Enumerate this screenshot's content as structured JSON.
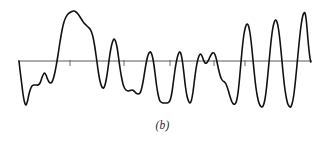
{
  "figure": {
    "caption": "(b)",
    "type": "waveform-trace",
    "background_color": "#ffffff",
    "trace_color": "#111111",
    "axis_color": "#5a5a5a",
    "caption_color": "#2a2a2a"
  },
  "chart_data": {
    "type": "line",
    "title": "",
    "subtitle": "",
    "xlabel": "",
    "ylabel": "",
    "annotations": [
      "(b)"
    ],
    "legend": [],
    "legend_position": "none",
    "grid": false,
    "xlim": [
      0,
      325
    ],
    "ylim": [
      0,
      143
    ],
    "baseline_y": 61,
    "baseline_x_start": 18,
    "baseline_x_end": 312,
    "tick_marks_x": [
      70,
      124,
      170,
      214,
      245
    ],
    "tick_length": 5,
    "series": [
      {
        "name": "signal",
        "color": "#111111",
        "line_width": 1.6,
        "points": [
          [
            19,
            61
          ],
          [
            20,
            70
          ],
          [
            21.5,
            82
          ],
          [
            23,
            94
          ],
          [
            24.5,
            102
          ],
          [
            26,
            105
          ],
          [
            27.5,
            101
          ],
          [
            29,
            94
          ],
          [
            30.5,
            89
          ],
          [
            32,
            86
          ],
          [
            34,
            85
          ],
          [
            36,
            85
          ],
          [
            38,
            85
          ],
          [
            40,
            83
          ],
          [
            41.5,
            79
          ],
          [
            43,
            75
          ],
          [
            44.5,
            73
          ],
          [
            46,
            75
          ],
          [
            47.5,
            79
          ],
          [
            49,
            82
          ],
          [
            50.5,
            83
          ],
          [
            52,
            82
          ],
          [
            53.5,
            78
          ],
          [
            55,
            72
          ],
          [
            56.5,
            64
          ],
          [
            58,
            55
          ],
          [
            59.5,
            45
          ],
          [
            61,
            36
          ],
          [
            62.5,
            28
          ],
          [
            64,
            22
          ],
          [
            66,
            17
          ],
          [
            68,
            14
          ],
          [
            70,
            12.5
          ],
          [
            72,
            11.5
          ],
          [
            74,
            11
          ],
          [
            76,
            12
          ],
          [
            78,
            14
          ],
          [
            80,
            17
          ],
          [
            82,
            20
          ],
          [
            84,
            23
          ],
          [
            86,
            25
          ],
          [
            88,
            27
          ],
          [
            90,
            29
          ],
          [
            91.5,
            32
          ],
          [
            93,
            37
          ],
          [
            94.5,
            45
          ],
          [
            96,
            55
          ],
          [
            97.5,
            66
          ],
          [
            99,
            76
          ],
          [
            100.5,
            83
          ],
          [
            102,
            87
          ],
          [
            103.5,
            88
          ],
          [
            105,
            85
          ],
          [
            106.5,
            78
          ],
          [
            108,
            68
          ],
          [
            109.5,
            57
          ],
          [
            111,
            48
          ],
          [
            112.5,
            42
          ],
          [
            114,
            39
          ],
          [
            115.5,
            41
          ],
          [
            117,
            47
          ],
          [
            118.5,
            57
          ],
          [
            120,
            68
          ],
          [
            121.5,
            77
          ],
          [
            123,
            84
          ],
          [
            124.5,
            88
          ],
          [
            126,
            90
          ],
          [
            128,
            91
          ],
          [
            130,
            90.5
          ],
          [
            132,
            90
          ],
          [
            134,
            91
          ],
          [
            136,
            93
          ],
          [
            138,
            94
          ],
          [
            140,
            93
          ],
          [
            141.5,
            89
          ],
          [
            143,
            82
          ],
          [
            144.5,
            73
          ],
          [
            146,
            64
          ],
          [
            147.5,
            57
          ],
          [
            149,
            53
          ],
          [
            150.5,
            52
          ],
          [
            152,
            55
          ],
          [
            153.5,
            62
          ],
          [
            155,
            73
          ],
          [
            156.5,
            85
          ],
          [
            158,
            94
          ],
          [
            159.5,
            100
          ],
          [
            161,
            102
          ],
          [
            163,
            103
          ],
          [
            165,
            103
          ],
          [
            167,
            103
          ],
          [
            169,
            102
          ],
          [
            170.5,
            99
          ],
          [
            172,
            92
          ],
          [
            173.5,
            81
          ],
          [
            175,
            70
          ],
          [
            176.5,
            61
          ],
          [
            178,
            55
          ],
          [
            179.5,
            52
          ],
          [
            181,
            54
          ],
          [
            182.5,
            62
          ],
          [
            184,
            74
          ],
          [
            185.5,
            87
          ],
          [
            187,
            96
          ],
          [
            188.5,
            101
          ],
          [
            190,
            103
          ],
          [
            191.5,
            100
          ],
          [
            193,
            92
          ],
          [
            194.5,
            80
          ],
          [
            196,
            69
          ],
          [
            197.5,
            61
          ],
          [
            199,
            56
          ],
          [
            200.5,
            54
          ],
          [
            202,
            56
          ],
          [
            203.5,
            60
          ],
          [
            205,
            63
          ],
          [
            206.5,
            63
          ],
          [
            208,
            61
          ],
          [
            209.5,
            58
          ],
          [
            211,
            55
          ],
          [
            212.5,
            53
          ],
          [
            214,
            53
          ],
          [
            215.5,
            56
          ],
          [
            217,
            62
          ],
          [
            218.5,
            69
          ],
          [
            220,
            75
          ],
          [
            221.5,
            79
          ],
          [
            223,
            81
          ],
          [
            224.5,
            82
          ],
          [
            226,
            84
          ],
          [
            227.5,
            88
          ],
          [
            229,
            93
          ],
          [
            230.5,
            98
          ],
          [
            232,
            102
          ],
          [
            233.5,
            104
          ],
          [
            235,
            104
          ],
          [
            236.5,
            101
          ],
          [
            238,
            93
          ],
          [
            239.5,
            79
          ],
          [
            241,
            62
          ],
          [
            242.5,
            46
          ],
          [
            244,
            34
          ],
          [
            245.5,
            27
          ],
          [
            247,
            24
          ],
          [
            248.5,
            26
          ],
          [
            250,
            33
          ],
          [
            251.5,
            45
          ],
          [
            253,
            60
          ],
          [
            254.5,
            75
          ],
          [
            256,
            88
          ],
          [
            257.5,
            97
          ],
          [
            259,
            103
          ],
          [
            260.5,
            106
          ],
          [
            262,
            107
          ],
          [
            263.5,
            105
          ],
          [
            265,
            99
          ],
          [
            266.5,
            88
          ],
          [
            268,
            73
          ],
          [
            269.5,
            57
          ],
          [
            271,
            42
          ],
          [
            272.5,
            30
          ],
          [
            274,
            23
          ],
          [
            275.5,
            20
          ],
          [
            277,
            22
          ],
          [
            278.5,
            29
          ],
          [
            280,
            41
          ],
          [
            281.5,
            56
          ],
          [
            283,
            72
          ],
          [
            284.5,
            86
          ],
          [
            286,
            96
          ],
          [
            287.5,
            103
          ],
          [
            289,
            106
          ],
          [
            290.5,
            107
          ],
          [
            292,
            104
          ],
          [
            293.5,
            97
          ],
          [
            295,
            85
          ],
          [
            296.5,
            70
          ],
          [
            298,
            54
          ],
          [
            299.5,
            39
          ],
          [
            301,
            26
          ],
          [
            302.5,
            17
          ],
          [
            304,
            13
          ],
          [
            305,
            13
          ],
          [
            306,
            18
          ],
          [
            307,
            28
          ],
          [
            308,
            40
          ],
          [
            309,
            50
          ],
          [
            310,
            58
          ],
          [
            310.8,
            62
          ]
        ]
      }
    ]
  }
}
